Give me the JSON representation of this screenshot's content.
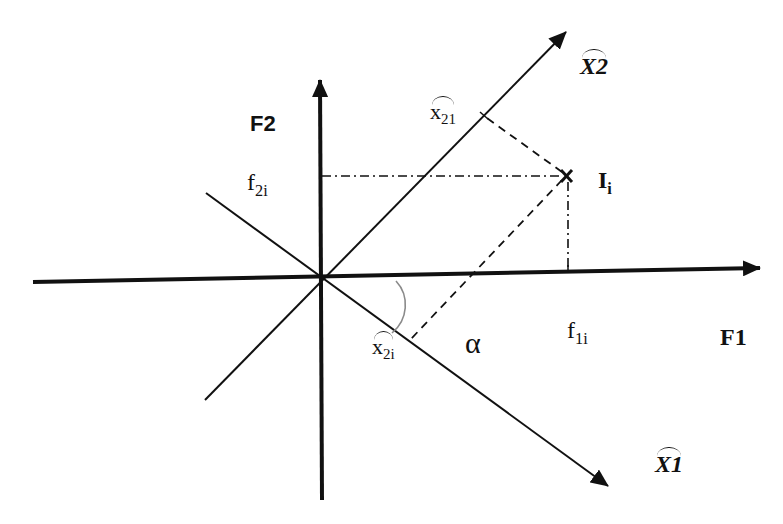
{
  "diagram": {
    "axes": {
      "F1": {
        "label": "F1"
      },
      "F2": {
        "label": "F2"
      }
    },
    "rotated_axes": {
      "X1": {
        "label": "X1",
        "hat": true
      },
      "X2": {
        "label": "X2",
        "hat": true
      }
    },
    "point": {
      "name": "I",
      "subscript": "i"
    },
    "projections": {
      "f1i": {
        "base": "f",
        "subscript": "1i"
      },
      "f2i": {
        "base": "f",
        "subscript": "2i"
      },
      "x21_top": {
        "base": "x",
        "subscript": "21",
        "hat": true
      },
      "x2i_bottom": {
        "base": "x",
        "subscript": "2i",
        "hat": true
      }
    },
    "angle": {
      "label": "α"
    },
    "colors": {
      "line": "#111111",
      "arc": "#8a8a8a",
      "background": "#ffffff"
    }
  }
}
